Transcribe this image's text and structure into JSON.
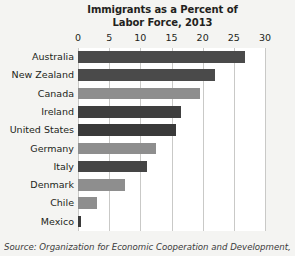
{
  "chart_data": {
    "type": "bar",
    "orientation": "horizontal",
    "title": "Immigrants as a Percent of Labor Force, 2013",
    "title_lines": [
      "Immigrants as a Percent of",
      "Labor Force, 2013"
    ],
    "xlabel": "",
    "ylabel": "",
    "xlim": [
      0,
      30
    ],
    "xticks": [
      0,
      5,
      10,
      15,
      20,
      25,
      30
    ],
    "xtick_labels": [
      "0",
      "5",
      "10",
      "15",
      "20",
      "25",
      "30"
    ],
    "grid": "vertical",
    "legend": "none",
    "categories": [
      "Australia",
      "New Zealand",
      "Canada",
      "Ireland",
      "United States",
      "Germany",
      "Italy",
      "Denmark",
      "Chile",
      "Mexico"
    ],
    "values": [
      26.8,
      22.0,
      19.5,
      16.5,
      15.8,
      12.5,
      11.0,
      7.5,
      3.1,
      0.5
    ],
    "bar_colors": [
      "#4a4a4a",
      "#4a4a4a",
      "#8e8e8e",
      "#3f3f3f",
      "#3a3a3a",
      "#8e8e8e",
      "#454545",
      "#8e8e8e",
      "#8e8e8e",
      "#3a3a3a"
    ],
    "units": "percent"
  },
  "source": {
    "text": "Source: Organization for Economic Cooperation and Development,"
  },
  "colors": {
    "background": "#f4f4f2",
    "plot_background": "#ffffff",
    "gridline": "#c9c9c7",
    "text": "#231f20",
    "bar_dark": "#4a4a4a",
    "bar_light": "#8e8e8e"
  }
}
